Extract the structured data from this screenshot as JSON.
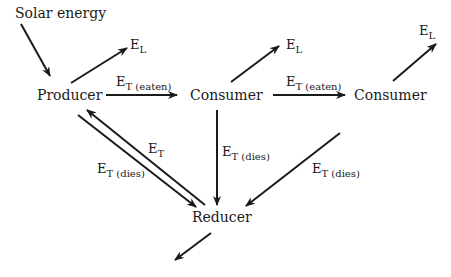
{
  "diagram": {
    "nodes": {
      "solar": "Solar energy",
      "producer": "Producer",
      "consumer1": "Consumer",
      "consumer2": "Consumer",
      "reducer": "Reducer"
    },
    "labels": {
      "el1": {
        "main": "E",
        "sub": "L"
      },
      "el2": {
        "main": "E",
        "sub": "L"
      },
      "el3": {
        "main": "E",
        "sub": "L"
      },
      "eaten1": {
        "main": "E",
        "sub": "T (eaten)"
      },
      "eaten2": {
        "main": "E",
        "sub": "T (eaten)"
      },
      "et_back": {
        "main": "E",
        "sub": "T"
      },
      "dies_prod": {
        "main": "E",
        "sub": "T (dies)"
      },
      "dies_cons1": {
        "main": "E",
        "sub": "T (dies)"
      },
      "dies_cons2": {
        "main": "E",
        "sub": "T (dies)"
      }
    },
    "edges": [
      {
        "from": "solar",
        "to": "producer"
      },
      {
        "from": "producer",
        "to": "E_L"
      },
      {
        "from": "producer",
        "to": "consumer1",
        "label": "E T (eaten)"
      },
      {
        "from": "consumer1",
        "to": "E_L"
      },
      {
        "from": "consumer1",
        "to": "consumer2",
        "label": "E T (eaten)"
      },
      {
        "from": "consumer2",
        "to": "E_L"
      },
      {
        "from": "producer",
        "to": "reducer",
        "label": "E T (dies)"
      },
      {
        "from": "reducer",
        "to": "producer",
        "label": "E T"
      },
      {
        "from": "consumer1",
        "to": "reducer",
        "label": "E T (dies)"
      },
      {
        "from": "consumer2",
        "to": "reducer",
        "label": "E T (dies)"
      },
      {
        "from": "reducer",
        "to": "out"
      }
    ]
  }
}
